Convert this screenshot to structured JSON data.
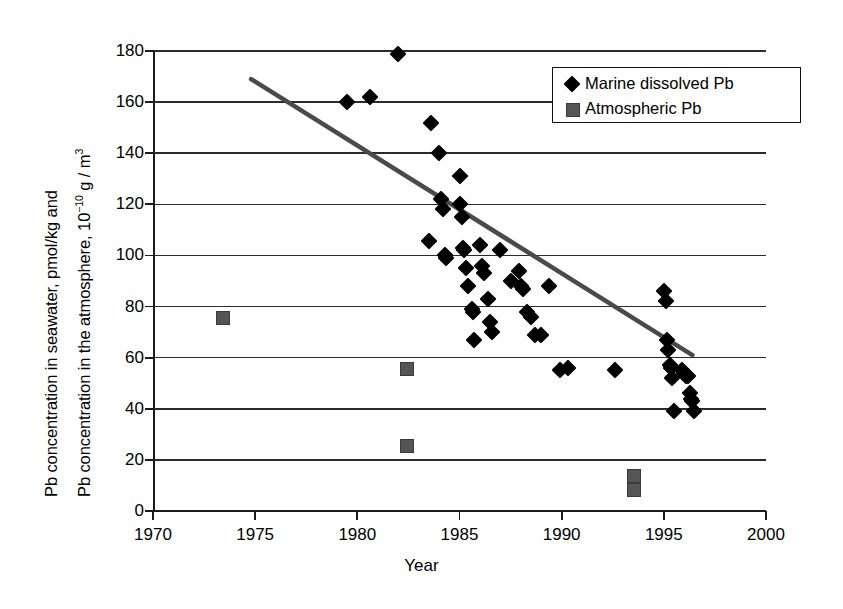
{
  "chart_data": {
    "type": "scatter",
    "title": "",
    "xlabel": "Year",
    "ylabel_line1": "Pb concentration in seawater, pmol/kg and",
    "ylabel_line2": "Pb concentration in the atmosphere, 10",
    "ylabel_line2_sup": "−10",
    "ylabel_line2_tail": " g / m",
    "ylabel_line2_sup2": "3",
    "xlim": [
      1970,
      2000
    ],
    "ylim": [
      0,
      180
    ],
    "xticks": [
      1970,
      1975,
      1980,
      1985,
      1990,
      1995,
      2000
    ],
    "yticks": [
      0,
      20,
      40,
      60,
      80,
      100,
      120,
      140,
      160,
      180
    ],
    "grid": "horizontal",
    "legend_position": "top-right",
    "series": [
      {
        "name": "Marine dissolved Pb",
        "marker": "diamond",
        "color": "#000000",
        "points": [
          [
            1979.5,
            160
          ],
          [
            1980.6,
            162
          ],
          [
            1982.0,
            179
          ],
          [
            1983.6,
            152
          ],
          [
            1983.5,
            105.5
          ],
          [
            1984.0,
            140
          ],
          [
            1984.1,
            122
          ],
          [
            1984.2,
            118
          ],
          [
            1984.3,
            100
          ],
          [
            1984.35,
            99
          ],
          [
            1985.0,
            131
          ],
          [
            1985.0,
            120
          ],
          [
            1985.1,
            115
          ],
          [
            1985.15,
            103
          ],
          [
            1985.2,
            102
          ],
          [
            1985.3,
            95
          ],
          [
            1985.4,
            88
          ],
          [
            1985.6,
            79
          ],
          [
            1985.65,
            78
          ],
          [
            1985.7,
            67
          ],
          [
            1986.0,
            104
          ],
          [
            1986.1,
            96
          ],
          [
            1986.2,
            93
          ],
          [
            1986.4,
            83
          ],
          [
            1986.5,
            74
          ],
          [
            1986.6,
            70
          ],
          [
            1987.0,
            102
          ],
          [
            1987.5,
            90
          ],
          [
            1987.9,
            94
          ],
          [
            1988.0,
            88
          ],
          [
            1988.1,
            87
          ],
          [
            1988.3,
            78
          ],
          [
            1988.5,
            76
          ],
          [
            1988.7,
            69
          ],
          [
            1989.0,
            69
          ],
          [
            1989.4,
            88
          ],
          [
            1989.9,
            55
          ],
          [
            1990.3,
            56
          ],
          [
            1992.6,
            55
          ],
          [
            1995.0,
            86
          ],
          [
            1995.1,
            82
          ],
          [
            1995.15,
            67
          ],
          [
            1995.2,
            63
          ],
          [
            1995.3,
            57
          ],
          [
            1995.35,
            56
          ],
          [
            1995.4,
            52
          ],
          [
            1995.5,
            39
          ],
          [
            1995.9,
            55
          ],
          [
            1996.0,
            54
          ],
          [
            1996.1,
            53
          ],
          [
            1996.2,
            53
          ],
          [
            1996.3,
            46
          ],
          [
            1996.35,
            44
          ],
          [
            1996.4,
            43
          ],
          [
            1996.5,
            39
          ]
        ]
      },
      {
        "name": "Atmospheric Pb",
        "marker": "square",
        "color": "#555555",
        "points": [
          [
            1973.4,
            76
          ],
          [
            1982.4,
            56
          ],
          [
            1982.4,
            26
          ],
          [
            1993.5,
            14
          ],
          [
            1993.5,
            8.5
          ]
        ]
      }
    ],
    "trendline": {
      "name": "linear trend",
      "color": "#4a4a4a",
      "x_start": 1974.8,
      "y_start": 169,
      "x_end": 1996.4,
      "y_end": 61
    }
  },
  "legend": {
    "items": [
      {
        "label": "Marine dissolved Pb",
        "marker": "diamond-icon"
      },
      {
        "label": "Atmospheric Pb",
        "marker": "square-icon"
      }
    ]
  },
  "axes": {
    "x_title": "Year",
    "x_tick_labels": [
      "1970",
      "1975",
      "1980",
      "1985",
      "1990",
      "1995",
      "2000"
    ],
    "y_tick_labels": [
      "180",
      "160",
      "140",
      "120",
      "100",
      "80",
      "60",
      "40",
      "20",
      "0"
    ]
  }
}
